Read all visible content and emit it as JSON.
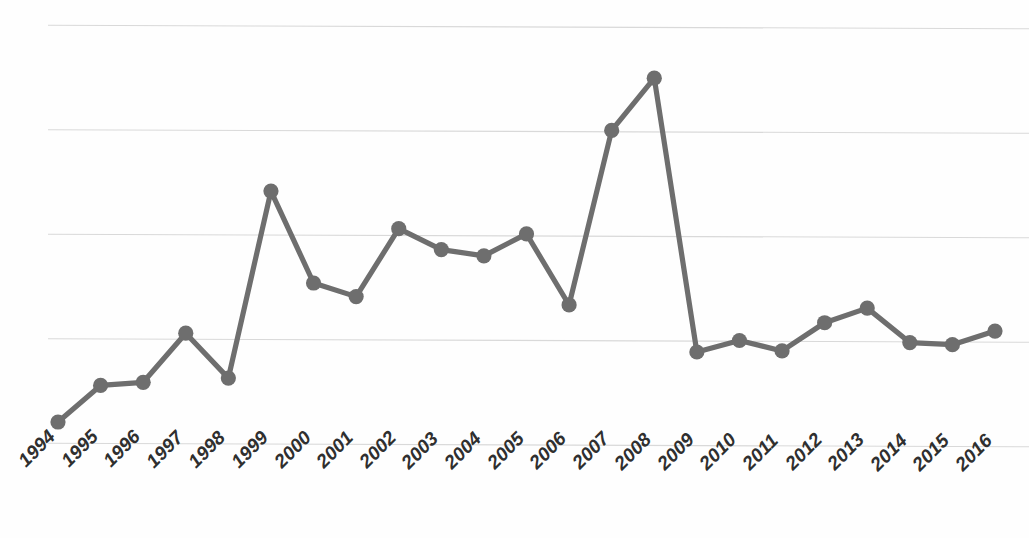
{
  "chart_data": {
    "type": "line",
    "title": "",
    "subtitle": "",
    "xlabel": "",
    "ylabel": "",
    "legend": [],
    "legend_position": "none",
    "grid": true,
    "gridlines_y": [
      0,
      1,
      2,
      3,
      4
    ],
    "ylim": [
      0,
      4
    ],
    "x_axis_type": "category",
    "categories": [
      "1994",
      "1995",
      "1996",
      "1997",
      "1998",
      "1999",
      "2000",
      "2001",
      "2002",
      "2003",
      "2004",
      "2005",
      "2006",
      "2007",
      "2008",
      "2009",
      "2010",
      "2011",
      "2012",
      "2013",
      "2014",
      "2015",
      "2016"
    ],
    "series": [
      {
        "name": "",
        "color": "#6e6e6e",
        "marker": "circle",
        "values": [
          0.22,
          0.57,
          0.6,
          1.07,
          0.64,
          2.43,
          1.55,
          1.42,
          2.07,
          1.87,
          1.81,
          2.02,
          1.34,
          3.01,
          3.51,
          0.89,
          1.0,
          0.9,
          1.17,
          1.31,
          0.98,
          0.96,
          1.09
        ]
      }
    ]
  },
  "x_axis": {
    "tick_labels": [
      "1994",
      "1995",
      "1996",
      "1997",
      "1998",
      "1999",
      "2000",
      "2001",
      "2002",
      "2003",
      "2004",
      "2005",
      "2006",
      "2007",
      "2008",
      "2009",
      "2010",
      "2011",
      "2012",
      "2013",
      "2014",
      "2015",
      "2016"
    ],
    "label_rotation": "-45"
  },
  "style": {
    "series_color": "#6e6e6e",
    "gridline_color": "#d9d9d9",
    "background_color": "#fefefe",
    "label_color": "#2f2f2f"
  }
}
